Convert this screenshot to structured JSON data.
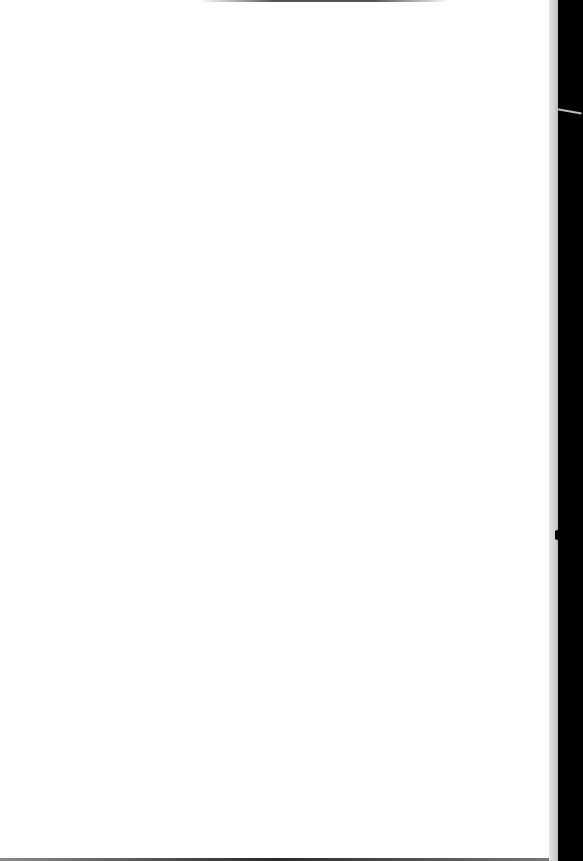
{
  "document": {
    "type": "scanned-page",
    "content": "",
    "colors": {
      "page": "#ffffff",
      "page_edge": "#d2d2d2",
      "background": "#000000"
    }
  }
}
